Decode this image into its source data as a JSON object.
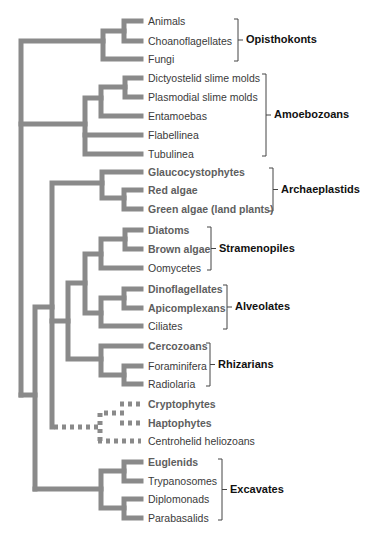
{
  "figure": {
    "type": "phylogenetic-tree",
    "line_color": "#8a8a8a",
    "leaf_text_color": "#3a3a3a",
    "highlight_leaf_color": "#5e5e5e",
    "group_label_color": "#111111"
  },
  "leaves": [
    {
      "label": "Animals",
      "y": 21,
      "bold": false
    },
    {
      "label": "Choanoflagellates",
      "y": 41,
      "bold": false
    },
    {
      "label": "Fungi",
      "y": 59,
      "bold": false
    },
    {
      "label": "Dictyostelid slime molds",
      "y": 78,
      "bold": false
    },
    {
      "label": "Plasmodial slime molds",
      "y": 97,
      "bold": false
    },
    {
      "label": "Entamoebas",
      "y": 116,
      "bold": false
    },
    {
      "label": "Flabellinea",
      "y": 135,
      "bold": false
    },
    {
      "label": "Tubulinea",
      "y": 154,
      "bold": false
    },
    {
      "label": "Glaucocystophytes",
      "y": 172,
      "bold": true
    },
    {
      "label": "Red algae",
      "y": 190,
      "bold": true
    },
    {
      "label": "Green algae (land plants)",
      "y": 209,
      "bold": true
    },
    {
      "label": "Diatoms",
      "y": 230,
      "bold": true
    },
    {
      "label": "Brown algae",
      "y": 249,
      "bold": true
    },
    {
      "label": "Oomycetes",
      "y": 268,
      "bold": false
    },
    {
      "label": "Dinoflagellates",
      "y": 289,
      "bold": true
    },
    {
      "label": "Apicomplexans",
      "y": 308,
      "bold": true
    },
    {
      "label": "Ciliates",
      "y": 326,
      "bold": false
    },
    {
      "label": "Cercozoans",
      "y": 346,
      "bold": true
    },
    {
      "label": "Foraminifera",
      "y": 366,
      "bold": false
    },
    {
      "label": "Radiolaria",
      "y": 384,
      "bold": false
    },
    {
      "label": "Cryptophytes",
      "y": 404,
      "bold": true
    },
    {
      "label": "Haptophytes",
      "y": 423,
      "bold": true
    },
    {
      "label": "Centrohelid heliozoans",
      "y": 441,
      "bold": false
    },
    {
      "label": "Euglenids",
      "y": 462,
      "bold": true
    },
    {
      "label": "Trypanosomes",
      "y": 481,
      "bold": false
    },
    {
      "label": "Diplomonads",
      "y": 499,
      "bold": false
    },
    {
      "label": "Parabasalids",
      "y": 518,
      "bold": false
    }
  ],
  "groups": [
    {
      "label": "Opisthokonts",
      "bracket_x": 238,
      "top": 19,
      "bottom": 61,
      "label_x": 246
    },
    {
      "label": "Amoebozoans",
      "bracket_x": 266,
      "top": 74,
      "bottom": 156,
      "label_x": 274
    },
    {
      "label": "Archaeplastids",
      "bracket_x": 273,
      "top": 168,
      "bottom": 211,
      "label_x": 281
    },
    {
      "label": "Stramenopiles",
      "bracket_x": 211,
      "top": 227,
      "bottom": 270,
      "label_x": 219
    },
    {
      "label": "Alveolates",
      "bracket_x": 227,
      "top": 285,
      "bottom": 329,
      "label_x": 235
    },
    {
      "label": "Rhizarians",
      "bracket_x": 210,
      "top": 343,
      "bottom": 386,
      "label_x": 218
    },
    {
      "label": "Excavates",
      "bracket_x": 222,
      "top": 459,
      "bottom": 520,
      "label_x": 230
    }
  ]
}
